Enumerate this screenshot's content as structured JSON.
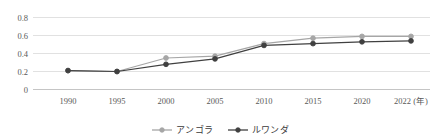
{
  "chart_data": {
    "type": "line",
    "title": "",
    "subtitle": "",
    "xlabel": "",
    "ylabel": "",
    "xlim": [
      1990,
      2022
    ],
    "ylim": [
      0,
      0.8
    ],
    "grid": true,
    "legend_position": "bottom-center",
    "categories": [
      "1990",
      "1995",
      "2000",
      "2005",
      "2010",
      "2015",
      "2020",
      "2022"
    ],
    "x": [
      1990,
      1995,
      2000,
      2005,
      2010,
      2015,
      2020,
      2022
    ],
    "x_tick_labels": [
      "1990",
      "1995",
      "2000",
      "2005",
      "2010",
      "2015",
      "2020",
      "2022"
    ],
    "x_axis_unit_label": "(年)",
    "x_last_tick_label": "2022 (年)",
    "y_tick_labels": [
      "0",
      "0.2",
      "0.4",
      "0.6",
      "0.8"
    ],
    "y_ticks": [
      0,
      0.2,
      0.4,
      0.6,
      0.8
    ],
    "series": [
      {
        "name": "アンゴラ",
        "color": "#a6a6a6",
        "marker": "circle",
        "values": [
          0.21,
          0.2,
          0.35,
          0.37,
          0.51,
          0.57,
          0.59,
          0.59
        ]
      },
      {
        "name": "ルワンダ",
        "color": "#404040",
        "marker": "circle",
        "values": [
          0.21,
          0.2,
          0.28,
          0.34,
          0.49,
          0.51,
          0.53,
          0.54
        ]
      }
    ]
  },
  "legend": {
    "items": [
      {
        "label": "アンゴラ",
        "color": "#a6a6a6"
      },
      {
        "label": "ルワンダ",
        "color": "#404040"
      }
    ]
  },
  "axes": {
    "y_tick_0": "0",
    "y_tick_1": "0.2",
    "y_tick_2": "0.4",
    "y_tick_3": "0.6",
    "y_tick_4": "0.8",
    "x_tick_0": "1990",
    "x_tick_1": "1995",
    "x_tick_2": "2000",
    "x_tick_3": "2005",
    "x_tick_4": "2010",
    "x_tick_5": "2015",
    "x_tick_6": "2020",
    "x_tick_7": "2022 (年)"
  },
  "colors": {
    "grid": "#d9d9d9",
    "axis": "#bfbfbf",
    "text": "#595959",
    "series_angola": "#a6a6a6",
    "series_rwanda": "#404040",
    "background": "#ffffff"
  }
}
